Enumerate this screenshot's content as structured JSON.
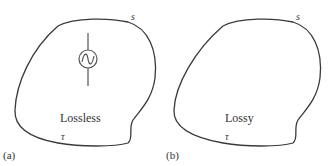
{
  "panels": [
    {
      "id": "a",
      "panel_label": "(a)",
      "surface_symbol": "s",
      "boundary_symbol": "τ",
      "region_label": "Lossless",
      "has_source": true,
      "source_icon": "ac-source-icon"
    },
    {
      "id": "b",
      "panel_label": "(b)",
      "surface_symbol": "s",
      "boundary_symbol": "τ",
      "region_label": "Lossy",
      "has_source": false
    }
  ],
  "colors": {
    "stroke": "#3a3a3a",
    "text": "#333333",
    "background": "#ffffff"
  }
}
